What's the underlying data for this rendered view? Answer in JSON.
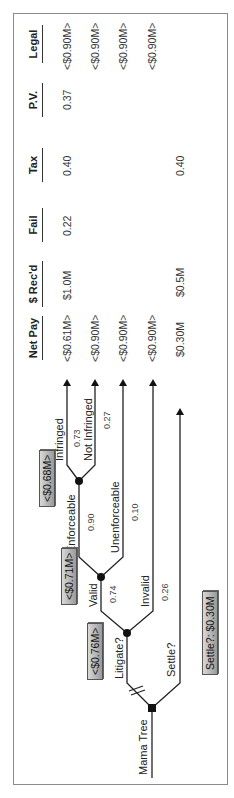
{
  "diagram": {
    "type": "decision-tree",
    "orientation": "rotated-90-ccw",
    "root_label": "Mama Tree",
    "decision": {
      "node_type": "decision",
      "options": [
        {
          "label": "Litigate?",
          "value_box": "<$0.76M>"
        },
        {
          "label": "Settle?",
          "value_box": "Settle?: $0.30M"
        }
      ]
    },
    "chance_nodes": [
      {
        "id": "validity",
        "value_box": "<$0.71M>",
        "branches": [
          {
            "label": "Valid",
            "probability": "0.74"
          },
          {
            "label": "Invalid",
            "probability": "0.26"
          }
        ]
      },
      {
        "id": "enforceability",
        "value_box": "<$0.68M>",
        "branches": [
          {
            "label": "Enforceable",
            "probability": "0.90"
          },
          {
            "label": "Unenforceable",
            "probability": "0.10"
          }
        ]
      },
      {
        "id": "infringement",
        "branches": [
          {
            "label": "Infringed",
            "probability": "0.73"
          },
          {
            "label": "Not Infringed",
            "probability": "0.27"
          }
        ]
      }
    ]
  },
  "table": {
    "headers": [
      "Net Pay",
      "$ Rec'd",
      "Fail",
      "Tax",
      "P.V.",
      "Legal"
    ],
    "rows": [
      {
        "outcome": "Infringed",
        "net_pay": "<$0.61M>",
        "rec": "$1.0M",
        "fail": "0.22",
        "tax": "0.40",
        "pv": "0.37",
        "legal": "<$0.90M>"
      },
      {
        "outcome": "Not Infringed",
        "net_pay": "<$0.90M>",
        "rec": "",
        "fail": "",
        "tax": "",
        "pv": "",
        "legal": "<$0.90M>"
      },
      {
        "outcome": "Unenforceable",
        "net_pay": "<$0.90M>",
        "rec": "",
        "fail": "",
        "tax": "",
        "pv": "",
        "legal": "<$0.90M>"
      },
      {
        "outcome": "Invalid",
        "net_pay": "<$0.90M>",
        "rec": "",
        "fail": "",
        "tax": "",
        "pv": "",
        "legal": "<$0.90M>"
      },
      {
        "outcome": "Settle",
        "net_pay": "$0.30M",
        "rec": "$0.5M",
        "fail": "",
        "tax": "0.40",
        "pv": "",
        "legal": ""
      }
    ]
  }
}
